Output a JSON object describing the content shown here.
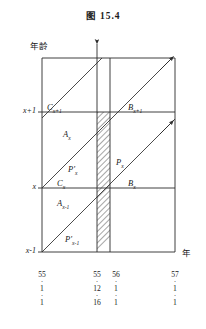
{
  "figure": {
    "caption_prefix": "图",
    "caption_number": "15.4",
    "caption_full": "图  15.4"
  },
  "axes": {
    "y_axis": {
      "title": "年龄",
      "title_meaning": "age",
      "ticks": [
        {
          "label": "x+1",
          "y_px": 112
        },
        {
          "label": "x",
          "y_px": 188
        },
        {
          "label": "x-1",
          "y_px": 252
        }
      ]
    },
    "x_axis": {
      "title": "年",
      "title_meaning": "year",
      "ticks": [
        {
          "lines": [
            "55",
            "1",
            "1"
          ],
          "x_px": 42
        },
        {
          "lines": [
            "55",
            "12",
            "16"
          ],
          "x_px": 97
        },
        {
          "lines": [
            "56",
            "1",
            "1"
          ],
          "x_px": 110
        },
        {
          "lines": [
            "57",
            "1",
            "1"
          ],
          "x_px": 175
        }
      ]
    }
  },
  "regions": [
    {
      "id": "C_x1",
      "base": "C",
      "sub": "x+1",
      "prime": false,
      "x_px": 47,
      "y_px": 108
    },
    {
      "id": "B_x1",
      "base": "B",
      "sub": "x+1",
      "prime": false,
      "x_px": 128,
      "y_px": 108
    },
    {
      "id": "A_x",
      "base": "A",
      "sub": "x",
      "prime": false,
      "x_px": 63,
      "y_px": 135
    },
    {
      "id": "P_px",
      "base": "P",
      "sub": "x",
      "prime": true,
      "x_px": 68,
      "y_px": 170
    },
    {
      "id": "P_x",
      "base": "P",
      "sub": "x",
      "prime": false,
      "x_px": 116,
      "y_px": 163
    },
    {
      "id": "C_x",
      "base": "C",
      "sub": "x",
      "prime": false,
      "x_px": 57,
      "y_px": 184
    },
    {
      "id": "B_x",
      "base": "B",
      "sub": "x",
      "prime": false,
      "x_px": 128,
      "y_px": 184
    },
    {
      "id": "A_xm1",
      "base": "A",
      "sub": "x-1",
      "prime": false,
      "x_px": 57,
      "y_px": 204
    },
    {
      "id": "P_pxm1",
      "base": "P",
      "sub": "x-1",
      "prime": true,
      "x_px": 65,
      "y_px": 240
    }
  ],
  "style": {
    "line_color": "#2b2b2b",
    "hatch_color": "#3a3a3a",
    "background": "#ffffff"
  },
  "hatched_region": {
    "name": "P_x",
    "description": "parallelogram between 55.12.16 and 56.1.1 verticals, bounded by the two cohort diagonals"
  }
}
